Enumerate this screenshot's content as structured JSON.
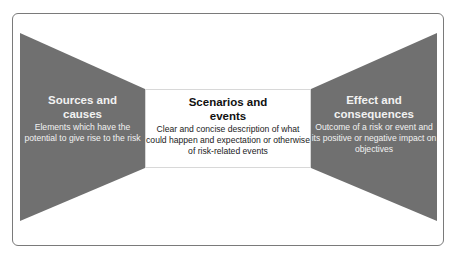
{
  "diagram": {
    "type": "bow-tie risk framework",
    "colors": {
      "shape_fill": "#707070",
      "center_fill": "#ffffff",
      "frame_border": "#7a7a7a",
      "shape_text": "#f2f2f2",
      "center_text": "#111111"
    },
    "left": {
      "title": "Sources and causes",
      "title_line1": "Sources and",
      "title_line2": "causes",
      "description": "Elements which  have the potential to give rise to the risk"
    },
    "center": {
      "title": "Scenarios and events",
      "title_line1": "Scenarios and",
      "title_line2": "events",
      "description": "Clear and concise description of what could happen and expectation or otherwise of risk-related events"
    },
    "right": {
      "title": "Effect and consequences",
      "title_line1": "Effect and",
      "title_line2": "consequences",
      "description": "Outcome of a risk or event and its positive or negative impact on objectives"
    }
  }
}
